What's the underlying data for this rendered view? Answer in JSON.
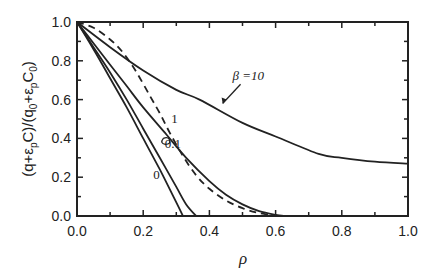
{
  "chart_data": {
    "type": "line",
    "title": "",
    "xlabel": "ρ",
    "ylabel": "(q+ε_pC)/(q_0+ε_pC_0)",
    "ylabel_parts": {
      "a": "(q+ε",
      "b": "p",
      "c": "C)/(q",
      "d": "0",
      "e": "+ε",
      "f": "p",
      "g": "C",
      "h": "0",
      "i": ")"
    },
    "xlim": [
      0.0,
      1.0
    ],
    "ylim": [
      0.0,
      1.0
    ],
    "xticks": [
      "0.0",
      "0.2",
      "0.4",
      "0.6",
      "0.8",
      "1.0"
    ],
    "yticks": [
      "0.0",
      "0.2",
      "0.4",
      "0.6",
      "0.8",
      "1.0"
    ],
    "grid": false,
    "legend": "inline annotations",
    "series": [
      {
        "name": "β=0",
        "label": "0",
        "style": "solid",
        "x": [
          0.0,
          0.05,
          0.1,
          0.15,
          0.2,
          0.25,
          0.3,
          0.32
        ],
        "y": [
          1.0,
          0.86,
          0.71,
          0.56,
          0.4,
          0.24,
          0.07,
          0.0
        ]
      },
      {
        "name": "β=0.1",
        "label": "0.1",
        "style": "solid",
        "x": [
          0.0,
          0.05,
          0.1,
          0.15,
          0.2,
          0.25,
          0.3,
          0.33,
          0.36
        ],
        "y": [
          1.0,
          0.87,
          0.74,
          0.6,
          0.45,
          0.3,
          0.15,
          0.06,
          0.0
        ]
      },
      {
        "name": "β=1",
        "label": "1",
        "style": "solid",
        "x": [
          0.0,
          0.05,
          0.1,
          0.15,
          0.2,
          0.27,
          0.33,
          0.4,
          0.45,
          0.5,
          0.55,
          0.6,
          0.63
        ],
        "y": [
          1.0,
          0.89,
          0.78,
          0.67,
          0.56,
          0.42,
          0.3,
          0.18,
          0.11,
          0.06,
          0.025,
          0.006,
          0.0
        ]
      },
      {
        "name": "dashed",
        "label": "",
        "style": "dashed",
        "x": [
          0.0,
          0.05,
          0.1,
          0.14,
          0.18,
          0.22,
          0.25,
          0.28,
          0.32,
          0.36,
          0.4,
          0.45,
          0.5,
          0.55,
          0.6
        ],
        "y": [
          1.0,
          0.97,
          0.91,
          0.84,
          0.74,
          0.62,
          0.53,
          0.43,
          0.31,
          0.21,
          0.14,
          0.08,
          0.04,
          0.015,
          0.0
        ]
      },
      {
        "name": "β=10",
        "label": "β =10",
        "style": "solid",
        "x": [
          0.0,
          0.1,
          0.2,
          0.3,
          0.37,
          0.5,
          0.6,
          0.73,
          0.8,
          0.9,
          1.0
        ],
        "y": [
          1.0,
          0.87,
          0.75,
          0.65,
          0.6,
          0.48,
          0.41,
          0.32,
          0.3,
          0.28,
          0.27
        ]
      }
    ],
    "annotations": [
      {
        "text": "β =10",
        "x": 0.47,
        "y": 0.7,
        "arrow_to": [
          0.44,
          0.58
        ]
      },
      {
        "text": "1",
        "x": 0.285,
        "y": 0.48
      },
      {
        "text": "0.1",
        "x": 0.265,
        "y": 0.35
      },
      {
        "text": "0",
        "x": 0.23,
        "y": 0.19
      }
    ]
  }
}
